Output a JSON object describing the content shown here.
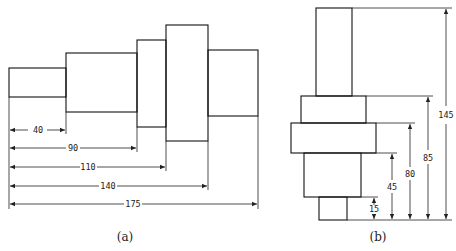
{
  "figure_a": {
    "caption": "(a)",
    "orientation": "horizontal",
    "dimensions": [
      {
        "label": "40",
        "value": 40
      },
      {
        "label": "90",
        "value": 90
      },
      {
        "label": "110",
        "value": 110
      },
      {
        "label": "140",
        "value": 140
      },
      {
        "label": "175",
        "value": 175
      }
    ]
  },
  "figure_b": {
    "caption": "(b)",
    "orientation": "vertical",
    "dimensions": [
      {
        "label": "15",
        "value": 15
      },
      {
        "label": "45",
        "value": 45
      },
      {
        "label": "80",
        "value": 80
      },
      {
        "label": "85",
        "value": 85
      },
      {
        "label": "145",
        "value": 145
      }
    ]
  },
  "colors": {
    "line": "#111111",
    "background": "#ffffff"
  }
}
